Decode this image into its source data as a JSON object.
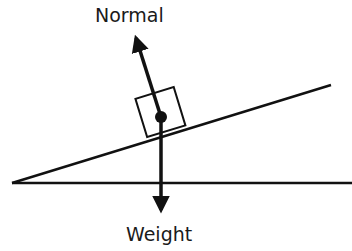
{
  "diagram": {
    "type": "free-body diagram on inclined plane",
    "labels": {
      "normal": "Normal",
      "weight": "Weight"
    },
    "colors": {
      "line": "#111111",
      "background": "#ffffff"
    }
  }
}
